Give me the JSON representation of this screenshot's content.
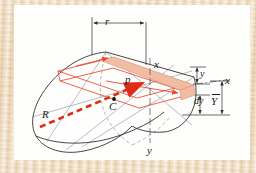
{
  "figure": {
    "kind": "engineering-mechanics-diagram",
    "paper_color": "#fefefd",
    "frame_color": "#e8d5b7",
    "outline_color": "#3d3d3d",
    "construction_color": "#8e99a8",
    "accent_color": "#e8492f",
    "shade_fill": "#f0bda3",
    "dash_arrow_color": "#e02b18"
  },
  "labels": {
    "radius_r": "r",
    "strip_x": "x",
    "point_p": "p",
    "axis_x": "x",
    "depth_y": "y",
    "differential_dy": "dy",
    "centroid_depth": "Y",
    "centroid_depth_overbar": true,
    "centroid_C": "C",
    "resultant_R": "R",
    "axis_y": "y"
  },
  "icons": {
    "centroid_marker": "filled-dot",
    "dimension_arrow": "double-headed-arrow",
    "resultant_arrow": "dashed-arrow"
  }
}
